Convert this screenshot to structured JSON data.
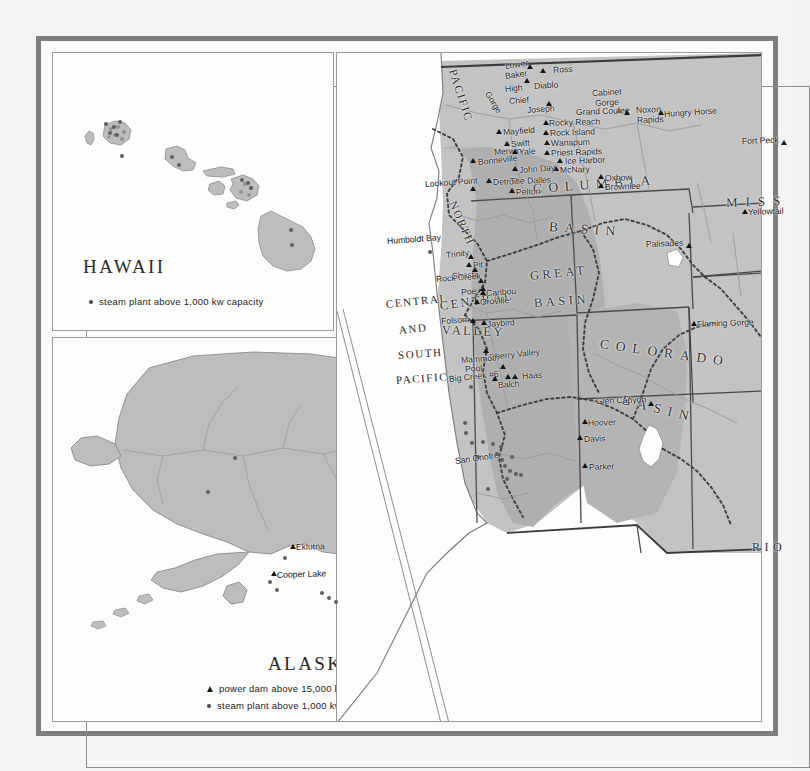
{
  "map": {
    "title_hawaii": "HAWAII",
    "title_alaska": "ALASKA",
    "legend": {
      "steam_label": "steam plant above 1,000 kw capacity",
      "power_label": "power dam above 15,000 kw capacity",
      "steam_icon": "filled-circle-icon",
      "power_icon": "filled-triangle-icon"
    },
    "colors": {
      "land_fill": "#bdbdbd",
      "land_fill_dark": "#ababab",
      "frame": "#7e7e7e",
      "paper": "#fdfdfc",
      "ink": "#141414",
      "water": "#fdfdfc"
    }
  },
  "regions": [
    {
      "name": "PACIFIC",
      "x": 452,
      "y": 64,
      "size": 11.5,
      "spacing": 1.6,
      "rot": 72
    },
    {
      "name": "NORTH",
      "x": 452,
      "y": 196,
      "size": 11.5,
      "spacing": 1.6,
      "rot": 66
    },
    {
      "name": "COLUMBIA",
      "x": 533,
      "y": 182,
      "size": 13.5,
      "spacing": 6.5,
      "rot": -4
    },
    {
      "name": "BASIN",
      "x": 549,
      "y": 220,
      "size": 13.5,
      "spacing": 6.5,
      "rot": 4
    },
    {
      "name": "MISS",
      "x": 726,
      "y": 196,
      "size": 13,
      "spacing": 8,
      "rot": -2
    },
    {
      "name": "GREAT",
      "x": 530,
      "y": 270,
      "size": 12.5,
      "spacing": 3.5,
      "rot": -6
    },
    {
      "name": "BASIN",
      "x": 534,
      "y": 297,
      "size": 12.5,
      "spacing": 3.5,
      "rot": -4
    },
    {
      "name": "COLORADO",
      "x": 600,
      "y": 337,
      "size": 13.5,
      "spacing": 7,
      "rot": 8
    },
    {
      "name": "BASIN",
      "x": 622,
      "y": 393,
      "size": 13.5,
      "spacing": 7,
      "rot": 14
    },
    {
      "name": "RIO",
      "x": 752,
      "y": 541,
      "size": 12,
      "spacing": 4.5,
      "rot": 0
    },
    {
      "name": "CENTRAL",
      "x": 386,
      "y": 299,
      "size": 11,
      "spacing": 1.6,
      "rot": -6
    },
    {
      "name": "AND",
      "x": 399,
      "y": 325,
      "size": 11,
      "spacing": 1.6,
      "rot": -6
    },
    {
      "name": "SOUTH",
      "x": 398,
      "y": 350,
      "size": 11,
      "spacing": 1.6,
      "rot": -4
    },
    {
      "name": "PACIFIC",
      "x": 396,
      "y": 375,
      "size": 11,
      "spacing": 1.6,
      "rot": -4
    },
    {
      "name": "CENTRAL",
      "x": 440,
      "y": 300,
      "size": 12.5,
      "spacing": 2.4,
      "rot": -8
    },
    {
      "name": "VALLEY",
      "x": 442,
      "y": 324,
      "size": 12.5,
      "spacing": 2.4,
      "rot": 2
    }
  ],
  "places": [
    {
      "name": "Lower",
      "lx": 505,
      "ly": 62,
      "tx": 527,
      "ty": 64,
      "type": "dam",
      "rot": -8
    },
    {
      "name": "Baker",
      "lx": 505,
      "ly": 72,
      "tx": 527,
      "ty": 64,
      "type": "none",
      "rot": -8
    },
    {
      "name": "Ross",
      "lx": 553,
      "ly": 66,
      "tx": 540,
      "ty": 68,
      "type": "dam",
      "rot": -4
    },
    {
      "name": "High",
      "lx": 505,
      "ly": 85,
      "tx": 524,
      "ty": 78,
      "type": "dam",
      "rot": -6
    },
    {
      "name": "Diablo",
      "lx": 534,
      "ly": 82,
      "tx": 524,
      "ty": 79,
      "type": "none",
      "rot": -4
    },
    {
      "name": "Gorge",
      "lx": 487,
      "ly": 88,
      "tx": 510,
      "ty": 84,
      "type": "none",
      "rot": 58
    },
    {
      "name": "Chief",
      "lx": 509,
      "ly": 97,
      "tx": 545,
      "ty": 100,
      "type": "none",
      "rot": -4
    },
    {
      "name": "Joseph",
      "lx": 527,
      "ly": 106,
      "tx": 546,
      "ty": 101,
      "type": "dam",
      "rot": -4
    },
    {
      "name": "Cabinet",
      "lx": 592,
      "ly": 89,
      "tx": 616,
      "ty": 107,
      "type": "none",
      "rot": -3
    },
    {
      "name": "Gorge",
      "lx": 595,
      "ly": 99,
      "tx": 616,
      "ty": 108,
      "type": "dam",
      "rot": -3
    },
    {
      "name": "Grand Coulee",
      "lx": 576,
      "ly": 108,
      "tx": 624,
      "ty": 110,
      "type": "dam",
      "rot": -2
    },
    {
      "name": "Noxon",
      "lx": 636,
      "ly": 106,
      "tx": 629,
      "ty": 108,
      "type": "none",
      "rot": -2
    },
    {
      "name": "Rapids",
      "lx": 637,
      "ly": 116,
      "tx": 629,
      "ty": 109,
      "type": "none",
      "rot": -2
    },
    {
      "name": "Hungry Horse",
      "lx": 664,
      "ly": 110,
      "tx": 658,
      "ty": 110,
      "type": "dam",
      "rot": -4
    },
    {
      "name": "Fort Peck",
      "lx": 742,
      "ly": 137,
      "tx": 781,
      "ty": 140,
      "type": "dam",
      "rot": -2
    },
    {
      "name": "Rocky Reach",
      "lx": 549,
      "ly": 119,
      "tx": 543,
      "ty": 120,
      "type": "dam",
      "rot": -2
    },
    {
      "name": "Rock Island",
      "lx": 550,
      "ly": 129,
      "tx": 543,
      "ty": 130,
      "type": "dam",
      "rot": -2
    },
    {
      "name": "Wanapum",
      "lx": 551,
      "ly": 139,
      "tx": 544,
      "ty": 140,
      "type": "dam",
      "rot": -2
    },
    {
      "name": "Priest Rapids",
      "lx": 551,
      "ly": 149,
      "tx": 544,
      "ty": 150,
      "type": "dam",
      "rot": -2
    },
    {
      "name": "Ice Harbor",
      "lx": 565,
      "ly": 157,
      "tx": 557,
      "ty": 158,
      "type": "dam",
      "rot": -2
    },
    {
      "name": "McNary",
      "lx": 560,
      "ly": 166,
      "tx": 553,
      "ty": 166,
      "type": "dam",
      "rot": -2
    },
    {
      "name": "Mayfield",
      "lx": 503,
      "ly": 128,
      "tx": 496,
      "ty": 129,
      "type": "dam",
      "rot": -4
    },
    {
      "name": "Swift",
      "lx": 511,
      "ly": 140,
      "tx": 504,
      "ty": 141,
      "type": "dam",
      "rot": -4
    },
    {
      "name": "Merwin",
      "lx": 494,
      "ly": 148,
      "tx": 487,
      "ty": 149,
      "type": "none",
      "rot": -4
    },
    {
      "name": "Yale",
      "lx": 519,
      "ly": 148,
      "tx": 512,
      "ty": 149,
      "type": "dam",
      "rot": -4
    },
    {
      "name": "Bonneville",
      "lx": 478,
      "ly": 158,
      "tx": 470,
      "ty": 158,
      "type": "dam",
      "rot": -6
    },
    {
      "name": "John Day",
      "lx": 519,
      "ly": 166,
      "tx": 512,
      "ty": 166,
      "type": "dam",
      "rot": -4
    },
    {
      "name": "The Dalles",
      "lx": 510,
      "ly": 177,
      "tx": 503,
      "ty": 178,
      "type": "none",
      "rot": -2
    },
    {
      "name": "Pelton",
      "lx": 516,
      "ly": 188,
      "tx": 509,
      "ty": 188,
      "type": "dam",
      "rot": -2
    },
    {
      "name": "Detroit",
      "lx": 493,
      "ly": 178,
      "tx": 486,
      "ty": 178,
      "type": "dam",
      "rot": -2
    },
    {
      "name": "Lookout Point",
      "lx": 425,
      "ly": 180,
      "tx": 470,
      "ty": 186,
      "type": "dam",
      "rot": -4
    },
    {
      "name": "Oxbow",
      "lx": 605,
      "ly": 174,
      "tx": 598,
      "ty": 174,
      "type": "dam",
      "rot": -2
    },
    {
      "name": "Brownlee",
      "lx": 605,
      "ly": 183,
      "tx": 598,
      "ty": 183,
      "type": "dam",
      "rot": -2
    },
    {
      "name": "Palisades",
      "lx": 646,
      "ly": 240,
      "tx": 686,
      "ty": 243,
      "type": "dam",
      "rot": -2
    },
    {
      "name": "Yellowtail",
      "lx": 748,
      "ly": 208,
      "tx": 742,
      "ty": 209,
      "type": "dam",
      "rot": -2
    },
    {
      "name": "Flaming Gorge",
      "lx": 697,
      "ly": 320,
      "tx": 691,
      "ty": 321,
      "type": "dam",
      "rot": -2
    },
    {
      "name": "Humboldt Bay",
      "lx": 387,
      "ly": 237,
      "tx": 428,
      "ty": 250,
      "type": "steam",
      "rot": -4
    },
    {
      "name": "Trinity",
      "lx": 446,
      "ly": 251,
      "tx": 468,
      "ty": 254,
      "type": "dam",
      "rot": -6
    },
    {
      "name": "Pit",
      "lx": 473,
      "ly": 261,
      "tx": 466,
      "ty": 262,
      "type": "dam",
      "rot": -4
    },
    {
      "name": "Shasta",
      "lx": 452,
      "ly": 272,
      "tx": 472,
      "ty": 267,
      "type": "dam",
      "rot": -4
    },
    {
      "name": "Rock Creek",
      "lx": 436,
      "ly": 275,
      "tx": 478,
      "ty": 278,
      "type": "dam",
      "rot": -4
    },
    {
      "name": "Poe",
      "lx": 461,
      "ly": 288,
      "tx": 480,
      "ty": 286,
      "type": "dam",
      "rot": -4
    },
    {
      "name": "Caribou",
      "lx": 486,
      "ly": 289,
      "tx": 480,
      "ty": 290,
      "type": "dam",
      "rot": -4
    },
    {
      "name": "Oroville",
      "lx": 480,
      "ly": 298,
      "tx": 474,
      "ty": 299,
      "type": "dam",
      "rot": -4
    },
    {
      "name": "Folsom",
      "lx": 441,
      "ly": 317,
      "tx": 470,
      "ty": 318,
      "type": "dam",
      "rot": -4
    },
    {
      "name": "Jaybird",
      "lx": 487,
      "ly": 320,
      "tx": 481,
      "ty": 320,
      "type": "dam",
      "rot": -4
    },
    {
      "name": "Cherry Valley",
      "lx": 489,
      "ly": 353,
      "tx": 483,
      "ty": 348,
      "type": "dam",
      "rot": -6
    },
    {
      "name": "Mammoth",
      "lx": 461,
      "ly": 356,
      "tx": 500,
      "ty": 363,
      "type": "none",
      "rot": -4
    },
    {
      "name": "Pool",
      "lx": 465,
      "ly": 365,
      "tx": 500,
      "ty": 364,
      "type": "dam",
      "rot": -4
    },
    {
      "name": "Big Creek #6",
      "lx": 449,
      "ly": 375,
      "tx": 492,
      "ty": 376,
      "type": "dam",
      "rot": -6
    },
    {
      "name": "Balch",
      "lx": 498,
      "ly": 381,
      "tx": 505,
      "ty": 374,
      "type": "dam",
      "rot": -4
    },
    {
      "name": "Haas",
      "lx": 522,
      "ly": 372,
      "tx": 512,
      "ty": 374,
      "type": "dam",
      "rot": -4
    },
    {
      "name": "San Onofre",
      "lx": 455,
      "ly": 457,
      "tx": 500,
      "ty": 462,
      "type": "none",
      "rot": -8
    },
    {
      "name": "Glen Canyon",
      "lx": 596,
      "ly": 397,
      "tx": 648,
      "ty": 401,
      "type": "dam",
      "rot": -2
    },
    {
      "name": "Hoover",
      "lx": 588,
      "ly": 419,
      "tx": 582,
      "ty": 419,
      "type": "dam",
      "rot": -2
    },
    {
      "name": "Davis",
      "lx": 584,
      "ly": 435,
      "tx": 577,
      "ty": 435,
      "type": "dam",
      "rot": -2
    },
    {
      "name": "Parker",
      "lx": 589,
      "ly": 463,
      "tx": 582,
      "ty": 463,
      "type": "dam",
      "rot": -2
    },
    {
      "name": "Eklutna",
      "lx": 296,
      "ly": 543,
      "tx": 290,
      "ty": 544,
      "type": "dam",
      "rot": -2
    },
    {
      "name": "Cooper Lake",
      "lx": 277,
      "ly": 571,
      "tx": 271,
      "ty": 571,
      "type": "dam",
      "rot": -2
    }
  ],
  "steam_plants": [
    {
      "x": 469,
      "y": 385
    },
    {
      "x": 463,
      "y": 421
    },
    {
      "x": 464,
      "y": 431
    },
    {
      "x": 470,
      "y": 441
    },
    {
      "x": 481,
      "y": 440
    },
    {
      "x": 491,
      "y": 442
    },
    {
      "x": 499,
      "y": 445
    },
    {
      "x": 476,
      "y": 455
    },
    {
      "x": 495,
      "y": 452
    },
    {
      "x": 500,
      "y": 458
    },
    {
      "x": 503,
      "y": 464
    },
    {
      "x": 508,
      "y": 469
    },
    {
      "x": 514,
      "y": 472
    },
    {
      "x": 519,
      "y": 473
    },
    {
      "x": 505,
      "y": 477
    },
    {
      "x": 510,
      "y": 455
    },
    {
      "x": 486,
      "y": 487
    },
    {
      "x": 283,
      "y": 556
    },
    {
      "x": 268,
      "y": 580
    },
    {
      "x": 275,
      "y": 588
    },
    {
      "x": 320,
      "y": 591
    },
    {
      "x": 327,
      "y": 596
    },
    {
      "x": 334,
      "y": 600
    },
    {
      "x": 233,
      "y": 456
    },
    {
      "x": 206,
      "y": 490
    },
    {
      "x": 104,
      "y": 122
    },
    {
      "x": 112,
      "y": 125
    },
    {
      "x": 118,
      "y": 120
    },
    {
      "x": 108,
      "y": 131
    },
    {
      "x": 115,
      "y": 133
    },
    {
      "x": 170,
      "y": 155
    },
    {
      "x": 240,
      "y": 178
    },
    {
      "x": 246,
      "y": 181
    },
    {
      "x": 249,
      "y": 186
    },
    {
      "x": 289,
      "y": 228
    }
  ]
}
